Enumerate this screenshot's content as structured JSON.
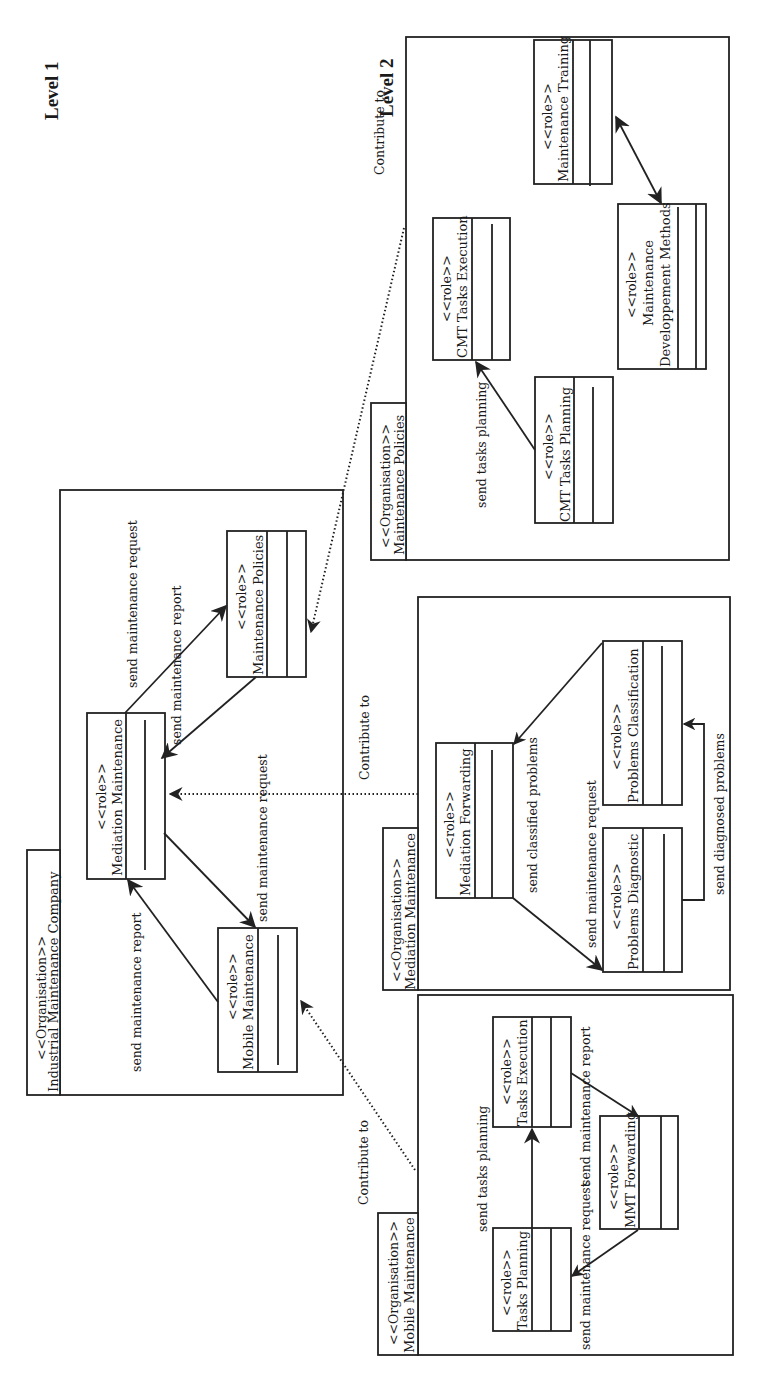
{
  "diagram": {
    "title_levels": [
      {
        "label": "Level 1",
        "x": 58,
        "y": 120
      },
      {
        "label": "Level 2",
        "x": 393,
        "y": 117
      }
    ],
    "relation_label": "Contribute to",
    "stereotypes": {
      "organisation": "<<Organisation>>",
      "role": "<<role>>"
    },
    "level1": {
      "organisation": "Industrial Maintenance Company",
      "roles": [
        {
          "id": "mediation_maintenance",
          "name": "Mediation Maintenance"
        },
        {
          "id": "maintenance_policies",
          "name": "Maintenance Policies"
        },
        {
          "id": "mobile_maintenance",
          "name": "Mobile Maintenance"
        }
      ],
      "messages": [
        {
          "from": "mediation_maintenance",
          "to": "maintenance_policies",
          "label": "send maintenance request"
        },
        {
          "from": "maintenance_policies",
          "to": "mediation_maintenance",
          "label": "send maintenance report"
        },
        {
          "from": "mediation_maintenance",
          "to": "mobile_maintenance",
          "label": "send maintenance request"
        },
        {
          "from": "mobile_maintenance",
          "to": "mediation_maintenance",
          "label": "send maintenance report"
        }
      ]
    },
    "level2": [
      {
        "organisation": "Maintenance Policies",
        "contributes_to": "maintenance_policies",
        "roles": [
          {
            "id": "cmt_tasks_planning",
            "name": "CMT Tasks Planning"
          },
          {
            "id": "cmt_tasks_execution",
            "name": "CMT Tasks Execution"
          },
          {
            "id": "maintenance_dev_methods",
            "name_line1": "Maintenance",
            "name_line2": "Developpement Methods"
          },
          {
            "id": "maintenance_training",
            "name": "Maintenance Training"
          }
        ],
        "messages": [
          {
            "from": "cmt_tasks_planning",
            "to": "cmt_tasks_execution",
            "label": "send tasks planning"
          },
          {
            "from": "maintenance_dev_methods",
            "to": "maintenance_training",
            "label": ""
          }
        ]
      },
      {
        "organisation": "Mediation Maintenance",
        "contributes_to": "mediation_maintenance",
        "roles": [
          {
            "id": "mediation_forwarding",
            "name": "Mediation Forwarding"
          },
          {
            "id": "problems_diagnostic",
            "name": "Problems Diagnostic"
          },
          {
            "id": "problems_classification",
            "name": "Problems Classification"
          }
        ],
        "messages": [
          {
            "from": "problems_classification",
            "to": "mediation_forwarding",
            "label": "send classified problems"
          },
          {
            "from": "mediation_forwarding",
            "to": "problems_diagnostic",
            "label": "send maintenance request"
          },
          {
            "from": "problems_diagnostic",
            "to": "problems_classification",
            "label": "send diagnosed problems"
          }
        ]
      },
      {
        "organisation": "Mobile Maintenance",
        "contributes_to": "mobile_maintenance",
        "roles": [
          {
            "id": "tasks_planning",
            "name": "Tasks Planning"
          },
          {
            "id": "tasks_execution",
            "name": "Tasks Execution"
          },
          {
            "id": "mmt_forwarding",
            "name": "MMT Forwarding"
          }
        ],
        "messages": [
          {
            "from": "tasks_planning",
            "to": "tasks_execution",
            "label": "send tasks planning"
          },
          {
            "from": "tasks_execution",
            "to": "mmt_forwarding",
            "label": "send maintenance report"
          },
          {
            "from": "mmt_forwarding",
            "to": "tasks_planning",
            "label": "send maintenance request"
          }
        ]
      }
    ]
  }
}
